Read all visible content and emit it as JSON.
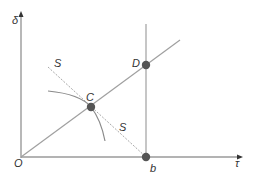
{
  "diagram": {
    "axes": {
      "y_label": "δ",
      "x_label": "τ",
      "origin_label": "O"
    },
    "points": {
      "C": {
        "label": "C"
      },
      "D": {
        "label": "D"
      },
      "b": {
        "label": "b"
      }
    },
    "curves": {
      "s_line_upper_label": "S",
      "s_line_lower_label": "S"
    },
    "colors": {
      "axis": "#9a9a9a",
      "line": "#a0a0a0",
      "point": "#555555",
      "text": "#333333"
    }
  }
}
